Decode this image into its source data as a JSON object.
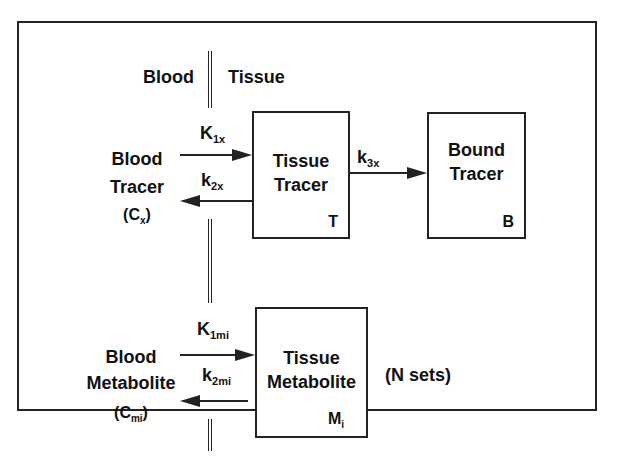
{
  "diagram": {
    "region_labels": {
      "left": "Blood",
      "right": "Tissue"
    },
    "blood_tracer": {
      "line1": "Blood",
      "line2": "Tracer",
      "symbol_open": "(C",
      "symbol_sub": "x",
      "symbol_close": ")"
    },
    "tissue_tracer": {
      "line1": "Tissue",
      "line2": "Tracer",
      "corner": "T"
    },
    "bound_tracer": {
      "line1": "Bound",
      "line2": "Tracer",
      "corner": "B"
    },
    "blood_metabolite": {
      "line1": "Blood",
      "line2": "Metabolite",
      "symbol_open": "(C",
      "symbol_sub": "mi",
      "symbol_close": ")"
    },
    "tissue_metabolite": {
      "line1": "Tissue",
      "line2": "Metabolite",
      "corner": "M",
      "corner_sub": "i"
    },
    "n_sets": "(N sets)",
    "rates": {
      "k1x": {
        "main": "K",
        "sub": "1x"
      },
      "k2x": {
        "main": "k",
        "sub": "2x"
      },
      "k3x": {
        "main": "k",
        "sub": "3x"
      },
      "k1mi": {
        "main": "K",
        "sub": "1mi"
      },
      "k2mi": {
        "main": "k",
        "sub": "2mi"
      }
    },
    "edges": [
      {
        "from": "Blood Tracer",
        "to": "Tissue Tracer",
        "rate": "K1x"
      },
      {
        "from": "Tissue Tracer",
        "to": "Blood Tracer",
        "rate": "k2x"
      },
      {
        "from": "Tissue Tracer",
        "to": "Bound Tracer",
        "rate": "k3x"
      },
      {
        "from": "Blood Metabolite",
        "to": "Tissue Metabolite",
        "rate": "K1mi"
      },
      {
        "from": "Tissue Metabolite",
        "to": "Blood Metabolite",
        "rate": "k2mi"
      }
    ],
    "colors": {
      "line": "#222222",
      "background": "#ffffff",
      "text": "#111111"
    }
  }
}
